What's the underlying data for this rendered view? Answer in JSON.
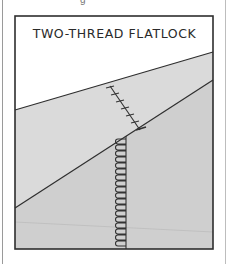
{
  "figure": {
    "title": "TWO-THREAD FLATLOCK",
    "top_fragment": "g",
    "colors": {
      "paper": "#ffffff",
      "frame": "#2e2e2e",
      "fabric_upper": "#d9d9d9",
      "fabric_lower": "#cdcdcd",
      "stitch": "#333333"
    }
  }
}
